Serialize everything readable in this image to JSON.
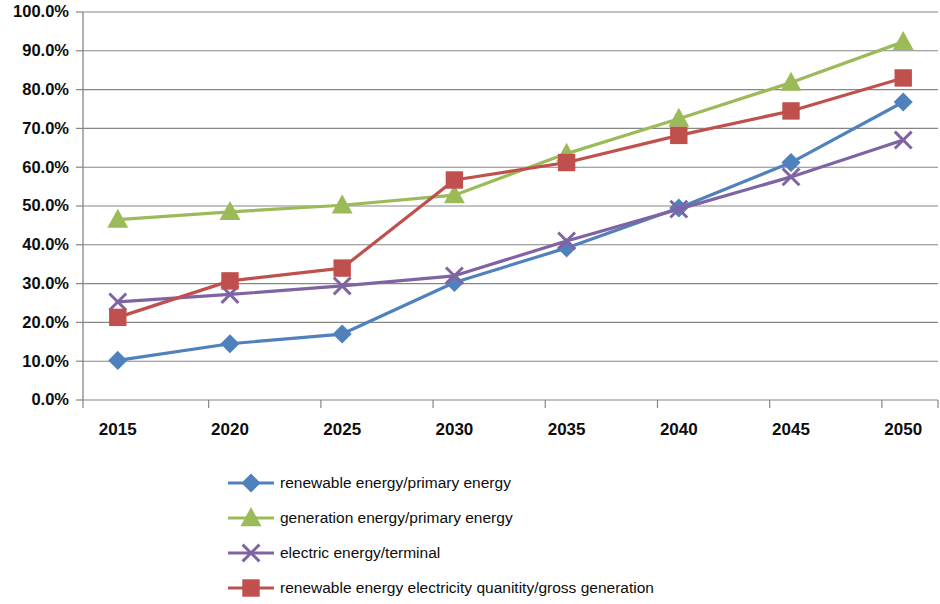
{
  "chart_data": {
    "type": "line",
    "title": "",
    "subtitle": "",
    "xlabel": "",
    "ylabel": "",
    "x": [
      2015,
      2020,
      2025,
      2030,
      2035,
      2040,
      2045,
      2050
    ],
    "categories": [
      "2015",
      "2020",
      "2025",
      "2030",
      "2035",
      "2040",
      "2045",
      "2050"
    ],
    "xtick_labels": [
      "2015",
      "2020",
      "2025",
      "2030",
      "2035",
      "2040",
      "2045",
      "2050"
    ],
    "ytick_labels": [
      "0.0%",
      "10.0%",
      "20.0%",
      "30.0%",
      "40.0%",
      "50.0%",
      "60.0%",
      "70.0%",
      "80.0%",
      "90.0%",
      "100.0%"
    ],
    "ytick_values": [
      0,
      10,
      20,
      30,
      40,
      50,
      60,
      70,
      80,
      90,
      100
    ],
    "ylim": [
      0,
      100
    ],
    "y_unit": "%",
    "grid": "horizontal",
    "legend_position": "bottom",
    "series": [
      {
        "name": "renewable energy/primary energy",
        "color": "#4F81BD",
        "marker": "diamond",
        "values": [
          10.2,
          14.5,
          17.0,
          30.3,
          39.2,
          49.5,
          61.2,
          76.8
        ]
      },
      {
        "name": "generation energy/primary energy",
        "color": "#9BBB59",
        "marker": "triangle",
        "values": [
          46.5,
          48.5,
          50.2,
          52.8,
          63.5,
          72.5,
          81.8,
          92.3
        ]
      },
      {
        "name": "electric energy/terminal",
        "color": "#8064A2",
        "marker": "x",
        "values": [
          25.3,
          27.2,
          29.4,
          32.0,
          41.0,
          49.2,
          57.5,
          67.0
        ]
      },
      {
        "name": "renewable energy electricity quanitity/gross generation",
        "color": "#C0504D",
        "marker": "square",
        "values": [
          21.3,
          30.7,
          34.0,
          56.7,
          61.2,
          68.2,
          74.5,
          83.0
        ]
      }
    ]
  },
  "legend": {
    "items": [
      {
        "label": "renewable energy/primary energy"
      },
      {
        "label": "generation energy/primary energy"
      },
      {
        "label": "electric energy/terminal"
      },
      {
        "label": "renewable energy electricity quanitity/gross generation"
      }
    ]
  },
  "colors": {
    "series_1": "#4F81BD",
    "series_2": "#9BBB59",
    "series_3": "#8064A2",
    "series_4": "#C0504D",
    "gridline": "#868686",
    "axis": "#868686",
    "text": "#0D0D0D",
    "background": "#FFFFFF"
  }
}
